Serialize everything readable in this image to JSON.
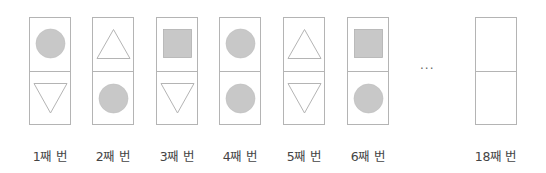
{
  "diagram": {
    "colors": {
      "fill": "#c8c8c8",
      "stroke": "#b4b4b4",
      "text": "#444444"
    },
    "cards": [
      {
        "index": 1,
        "label": "1째 번",
        "top": "circle",
        "bottom": "triangle-down"
      },
      {
        "index": 2,
        "label": "2째 번",
        "top": "triangle-up",
        "bottom": "circle"
      },
      {
        "index": 3,
        "label": "3째 번",
        "top": "square",
        "bottom": "triangle-down"
      },
      {
        "index": 4,
        "label": "4째 번",
        "top": "circle",
        "bottom": "circle"
      },
      {
        "index": 5,
        "label": "5째 번",
        "top": "triangle-up",
        "bottom": "triangle-down"
      },
      {
        "index": 6,
        "label": "6째 번",
        "top": "square",
        "bottom": "circle"
      },
      {
        "index": 18,
        "label": "18째 번",
        "top": "blank",
        "bottom": "blank"
      }
    ],
    "ellipsis": "···"
  }
}
